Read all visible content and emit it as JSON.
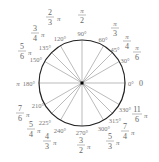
{
  "diagram": {
    "center": [
      82,
      83
    ],
    "radius": 43,
    "colors": {
      "circle": "#222222",
      "radial": "#aaaaaa",
      "text": "#666666",
      "center_dot": "#000000"
    },
    "angles": [
      {
        "deg": 0,
        "deg_label": "0°",
        "rad_label": "0"
      },
      {
        "deg": 30,
        "deg_label": "30°",
        "rad_num": "π",
        "rad_den": "6"
      },
      {
        "deg": 45,
        "deg_label": "45°",
        "rad_num": "π",
        "rad_den": "4"
      },
      {
        "deg": 60,
        "deg_label": "60°",
        "rad_num": "π",
        "rad_den": "3"
      },
      {
        "deg": 90,
        "deg_label": "90°",
        "rad_num": "π",
        "rad_den": "2"
      },
      {
        "deg": 120,
        "deg_label": "120°",
        "rad_num": "2",
        "rad_den": "3",
        "rad_suffix": "π"
      },
      {
        "deg": 135,
        "deg_label": "135°",
        "rad_num": "3",
        "rad_den": "4",
        "rad_suffix": "π"
      },
      {
        "deg": 150,
        "deg_label": "150°",
        "rad_num": "5",
        "rad_den": "6",
        "rad_suffix": "π"
      },
      {
        "deg": 180,
        "deg_label": "180°",
        "rad_label": "π"
      },
      {
        "deg": 210,
        "deg_label": "210°",
        "rad_num": "7",
        "rad_den": "6",
        "rad_suffix": "π"
      },
      {
        "deg": 225,
        "deg_label": "225°",
        "rad_num": "5",
        "rad_den": "4",
        "rad_suffix": "π"
      },
      {
        "deg": 240,
        "deg_label": "240°",
        "rad_num": "4",
        "rad_den": "3",
        "rad_suffix": "π"
      },
      {
        "deg": 270,
        "deg_label": "270°",
        "rad_num": "3",
        "rad_den": "2",
        "rad_suffix": "π"
      },
      {
        "deg": 300,
        "deg_label": "300°",
        "rad_num": "5",
        "rad_den": "3",
        "rad_suffix": "π"
      },
      {
        "deg": 315,
        "deg_label": "315°",
        "rad_num": "7",
        "rad_den": "4",
        "rad_suffix": "π"
      },
      {
        "deg": 330,
        "deg_label": "330°",
        "rad_num": "11",
        "rad_den": "6",
        "rad_suffix": "π"
      }
    ]
  }
}
